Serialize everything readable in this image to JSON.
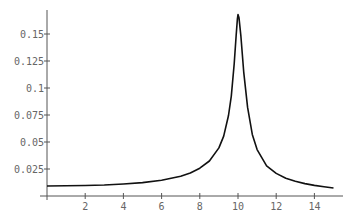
{
  "chart_data": {
    "type": "line",
    "title": "",
    "xlabel": "",
    "ylabel": "",
    "xlim": [
      0,
      15
    ],
    "ylim": [
      0,
      0.172
    ],
    "grid": false,
    "legend": null,
    "x_ticks": [
      2,
      4,
      6,
      8,
      10,
      12,
      14
    ],
    "x_tick_labels": [
      "2",
      "4",
      "6",
      "8",
      "10",
      "12",
      "14"
    ],
    "y_ticks": [
      0.025,
      0.05,
      0.075,
      0.1,
      0.125,
      0.15
    ],
    "y_tick_labels": [
      "0.025",
      "0.05",
      "0.075",
      "0.1",
      "0.125",
      "0.15"
    ],
    "series": [
      {
        "name": "curve",
        "color": "#111111",
        "x": [
          0,
          1,
          2,
          3,
          4,
          5,
          6,
          7,
          7.5,
          8,
          8.5,
          9,
          9.25,
          9.5,
          9.65,
          9.8,
          9.9,
          9.97,
          10.0,
          10.05,
          10.15,
          10.3,
          10.5,
          10.75,
          11,
          11.5,
          12,
          12.5,
          13,
          13.5,
          14,
          14.5,
          15
        ],
        "y": [
          0.0093,
          0.0094,
          0.0097,
          0.0102,
          0.0111,
          0.0124,
          0.0145,
          0.0182,
          0.0213,
          0.0257,
          0.0324,
          0.0445,
          0.0555,
          0.0745,
          0.0925,
          0.1225,
          0.148,
          0.164,
          0.168,
          0.165,
          0.148,
          0.115,
          0.082,
          0.057,
          0.043,
          0.028,
          0.0209,
          0.0165,
          0.0136,
          0.0115,
          0.0098,
          0.0085,
          0.0074
        ]
      }
    ]
  },
  "axes": {
    "x_labels": [
      "2",
      "4",
      "6",
      "8",
      "10",
      "12",
      "14"
    ],
    "y_labels": [
      "0.025",
      "0.05",
      "0.075",
      "0.1",
      "0.125",
      "0.15"
    ]
  }
}
